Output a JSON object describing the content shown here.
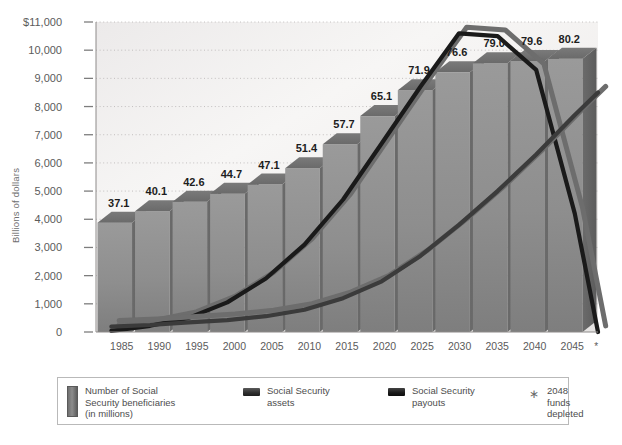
{
  "chart_data": {
    "type": "bar",
    "title": "",
    "subtitle": "",
    "xlabel": "",
    "ylabel": "Billions of dollars",
    "categories": [
      "1985",
      "1990",
      "1995",
      "2000",
      "2005",
      "2010",
      "2015",
      "2020",
      "2025",
      "2030",
      "2035",
      "2040",
      "2045"
    ],
    "values": [
      37.1,
      40.1,
      42.6,
      44.7,
      47.1,
      51.4,
      57.7,
      65.1,
      71.9,
      76.6,
      79.0,
      79.6,
      80.2
    ],
    "value_labels": [
      "37.1",
      "40.1",
      "42.6",
      "44.7",
      "47.1",
      "51.4",
      "57.7",
      "65.1",
      "71.9",
      "76.6",
      "79.0",
      "79.6",
      "80.2"
    ],
    "bar_series_name": "Number of Social Security beneficiaries (in millions)",
    "bar_units": "millions of beneficiaries",
    "bar_axis_note": "Bar heights are drawn on the same panel as the dollar axis; label values are beneficiary counts in millions.",
    "ylim": [
      0,
      11000
    ],
    "yticks": [
      0,
      1000,
      2000,
      3000,
      4000,
      5000,
      6000,
      7000,
      8000,
      9000,
      10000,
      11000
    ],
    "ytick_labels": [
      "0",
      "1,000",
      "2,000",
      "3,000",
      "4,000",
      "5,000",
      "6,000",
      "7,000",
      "8,000",
      "9,000",
      "10,000",
      "$11,000"
    ],
    "xlim": [
      1983,
      2048
    ],
    "grid": true,
    "grid_style": "dotted horizontal",
    "legend_position": "bottom",
    "xaxis_footnote_marker": "*",
    "series": [
      {
        "name": "Social Security assets",
        "type": "line",
        "color": "#1a1a1a",
        "x": [
          1985,
          1990,
          1995,
          2000,
          2005,
          2010,
          2015,
          2020,
          2025,
          2030,
          2035,
          2040,
          2045,
          2048
        ],
        "values": [
          40,
          220,
          500,
          1050,
          1900,
          3100,
          4700,
          6700,
          8700,
          10600,
          10500,
          9300,
          4200,
          0
        ]
      },
      {
        "name": "Social Security payouts",
        "type": "line",
        "color": "#3b3b3b",
        "x": [
          1985,
          1990,
          1995,
          2000,
          2005,
          2010,
          2015,
          2020,
          2025,
          2030,
          2035,
          2040,
          2045,
          2048
        ],
        "values": [
          190,
          250,
          340,
          420,
          560,
          790,
          1200,
          1800,
          2700,
          3800,
          5000,
          6300,
          7700,
          8500
        ]
      }
    ],
    "annotations": [
      {
        "marker": "*",
        "text": "2048 funds depleted"
      }
    ]
  },
  "legend": {
    "items": [
      {
        "swatch": "bar-swatch",
        "label": "Number of Social\nSecurity beneficiaries\n(in millions)"
      },
      {
        "swatch": "line-swatch-assets",
        "label": "Social Security\nassets"
      },
      {
        "swatch": "line-swatch-payouts",
        "label": "Social Security\npayouts"
      },
      {
        "swatch": "asterisk-marker",
        "label": "2048 funds\ndepleted"
      }
    ]
  }
}
